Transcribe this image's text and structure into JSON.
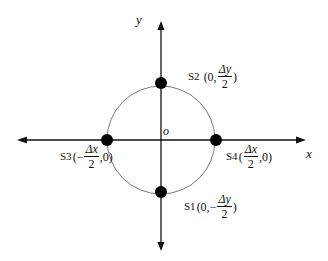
{
  "diagram": {
    "axes": {
      "x_label": "x",
      "y_label": "y",
      "origin_label": "o"
    },
    "circle": {
      "center": [
        161,
        140
      ],
      "radius": 54
    },
    "points": [
      {
        "id": "S1",
        "name": "S1",
        "coord_prefix": "(0,",
        "sign": "−",
        "numerator": "Δy",
        "denominator": "2",
        "coord_suffix": ")",
        "position": "bottom"
      },
      {
        "id": "S2",
        "name": "S2",
        "coord_prefix": "(0,",
        "sign": "",
        "numerator": "Δy",
        "denominator": "2",
        "coord_suffix": ")",
        "position": "top"
      },
      {
        "id": "S3",
        "name": "S3",
        "coord_prefix": "(",
        "sign": "−",
        "numerator": "Δx",
        "denominator": "2",
        "coord_suffix": ",0)",
        "position": "left"
      },
      {
        "id": "S4",
        "name": "S4",
        "coord_prefix": "(",
        "sign": "",
        "numerator": "Δx",
        "denominator": "2",
        "coord_suffix": ",0)",
        "position": "right"
      }
    ],
    "colors": {
      "axis": "#111111",
      "circle": "#777777",
      "point": "#000000"
    }
  }
}
